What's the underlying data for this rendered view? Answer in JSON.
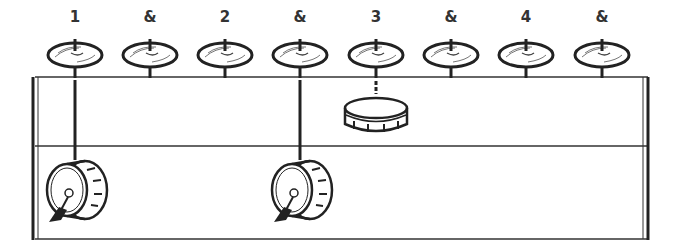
{
  "diagram": {
    "type": "drum-groove",
    "counts": [
      "1",
      "&",
      "2",
      "&",
      "3",
      "&",
      "4",
      "&"
    ],
    "hihat_positions": [
      75,
      150,
      225,
      300,
      376,
      451,
      526,
      602
    ],
    "snare_on": [
      "3"
    ],
    "kick_on": [
      "1",
      "&"
    ],
    "kick_positions": [
      75,
      300
    ],
    "snare_position": 376,
    "ink_color": "#222222",
    "background": "#ffffff"
  }
}
